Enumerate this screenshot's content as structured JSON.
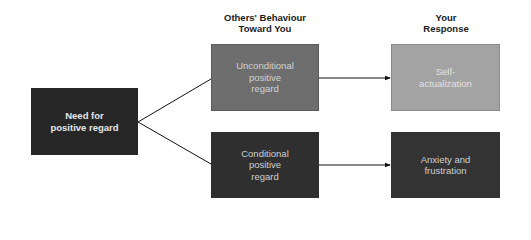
{
  "columns": {
    "behaviour_header": "Others' Behaviour\nToward You",
    "response_header": "Your\nResponse"
  },
  "nodes": {
    "need": {
      "label": "Need for\npositive regard",
      "fill": "#262626",
      "text_color": "#e6e6e6"
    },
    "unconditional": {
      "label": "Unconditional\npositive\nregard",
      "fill": "#6e6e6e",
      "text_color": "#d2d2d2"
    },
    "conditional": {
      "label": "Conditional\npositive\nregard",
      "fill": "#2f2f2f",
      "text_color": "#d0d0d0"
    },
    "self_actualization": {
      "label": "Self-\nactualization",
      "fill": "#a3a3a3",
      "text_color": "#e2e2e2"
    },
    "anxiety": {
      "label": "Anxiety and\nfrustration",
      "fill": "#333333",
      "text_color": "#d0d0d0"
    }
  },
  "edges": [
    {
      "from": "need",
      "to": "unconditional",
      "arrow": false
    },
    {
      "from": "need",
      "to": "conditional",
      "arrow": false
    },
    {
      "from": "unconditional",
      "to": "self_actualization",
      "arrow": true
    },
    {
      "from": "conditional",
      "to": "anxiety",
      "arrow": true
    }
  ]
}
